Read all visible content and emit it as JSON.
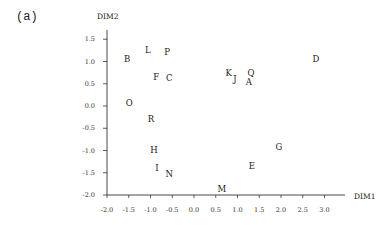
{
  "panel_label": "(a)",
  "chart_data": {
    "type": "scatter",
    "title": "",
    "xlabel": "DIM1",
    "ylabel": "DIM2",
    "xlim": [
      -2.0,
      3.3
    ],
    "ylim": [
      -2.0,
      1.75
    ],
    "grid": false,
    "legend": null,
    "x_ticks": [
      "-2.0",
      "-1.5",
      "-1.0",
      "-0.5",
      "0.0",
      "0.5",
      "1.0",
      "1.5",
      "2.0",
      "2.5",
      "3.0"
    ],
    "y_ticks": [
      "1.5",
      "1.0",
      "0.5",
      "0.0",
      "-0.5",
      "-1.0",
      "-1.5",
      "-2.0"
    ],
    "points": [
      {
        "label": "A",
        "x": 1.26,
        "y": 0.54
      },
      {
        "label": "B",
        "x": -1.54,
        "y": 1.06
      },
      {
        "label": "C",
        "x": -0.57,
        "y": 0.63
      },
      {
        "label": "D",
        "x": 2.8,
        "y": 1.06
      },
      {
        "label": "E",
        "x": 1.33,
        "y": -1.35
      },
      {
        "label": "F",
        "x": -0.87,
        "y": 0.65
      },
      {
        "label": "G",
        "x": 1.95,
        "y": -0.92
      },
      {
        "label": "H",
        "x": -0.92,
        "y": -0.99
      },
      {
        "label": "I",
        "x": -0.85,
        "y": -1.39
      },
      {
        "label": "J",
        "x": 0.94,
        "y": 0.61
      },
      {
        "label": "K",
        "x": 0.8,
        "y": 0.74
      },
      {
        "label": "L",
        "x": -1.06,
        "y": 1.26
      },
      {
        "label": "M",
        "x": 0.64,
        "y": -1.87
      },
      {
        "label": "N",
        "x": -0.57,
        "y": -1.53
      },
      {
        "label": "O",
        "x": -1.49,
        "y": 0.07
      },
      {
        "label": "P",
        "x": -0.62,
        "y": 1.21
      },
      {
        "label": "Q",
        "x": 1.31,
        "y": 0.74
      },
      {
        "label": "R",
        "x": -0.99,
        "y": -0.29
      }
    ]
  }
}
